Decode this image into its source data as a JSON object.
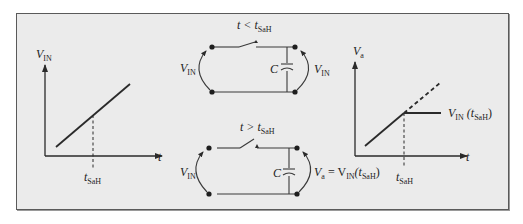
{
  "figure": {
    "background": "#ebebeb",
    "border_color": "#5a5a5a",
    "line_color": "#2a2a2a"
  },
  "left_graph": {
    "y_axis_label": "V",
    "y_axis_sub": "IN",
    "x_axis_label": "t",
    "marker_label": "t",
    "marker_sub": "SaH"
  },
  "circuit_top": {
    "condition_label": "t < t",
    "condition_sub": "SaH",
    "left_label": "V",
    "left_sub": "IN",
    "capacitor_label": "C",
    "right_label": "V",
    "right_sub": "IN"
  },
  "circuit_bottom": {
    "condition_label": "t > t",
    "condition_sub": "SaH",
    "left_label": "V",
    "left_sub": "IN",
    "capacitor_label": "C",
    "right_label_a": "V",
    "right_sub_a": "a",
    "right_eq": " = V",
    "right_sub_in": "IN",
    "right_paren_open": "(t",
    "right_sub_sah": "SaH",
    "right_paren_close": ")"
  },
  "right_graph": {
    "y_axis_label": "V",
    "y_axis_sub": "a",
    "x_axis_label": "t",
    "marker_label": "t",
    "marker_sub": "SaH",
    "hold_label": "V",
    "hold_sub": "IN",
    "hold_arg_open": " (t",
    "hold_arg_sub": "SaH",
    "hold_arg_close": ")"
  }
}
